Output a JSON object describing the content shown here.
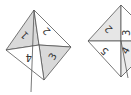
{
  "diagram": {
    "colors": {
      "shade": "#d9d9d9",
      "line": "#555555",
      "background": "#ffffff"
    },
    "figure_left": {
      "labels": {
        "q1": "1",
        "q2": "2",
        "q3": "3",
        "q4": "4"
      }
    },
    "figure_right": {
      "labels": {
        "q2": "2",
        "q5": "5",
        "q3": "3",
        "q4": "4"
      }
    }
  }
}
